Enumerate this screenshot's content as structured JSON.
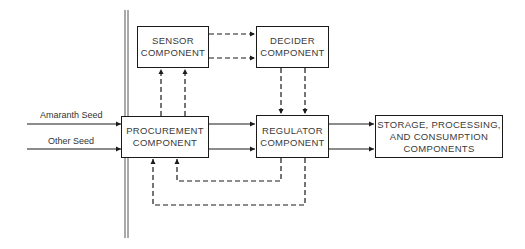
{
  "diagram": {
    "boxes": {
      "sensor": {
        "line1": "SENSOR",
        "line2": "COMPONENT"
      },
      "decider": {
        "line1": "DECIDER",
        "line2": "COMPONENT"
      },
      "procurement": {
        "line1": "PROCUREMENT",
        "line2": "COMPONENT"
      },
      "regulator": {
        "line1": "REGULATOR",
        "line2": "COMPONENT"
      },
      "storage": {
        "line1": "STORAGE, PROCESSING,",
        "line2": "AND CONSUMPTION",
        "line3": "COMPONENTS"
      }
    },
    "inputs": [
      {
        "label": "Amaranth Seed"
      },
      {
        "label": "Other Seed"
      }
    ],
    "colors": {
      "line": "#1a1a1a",
      "text": "#3a3a3a",
      "background": "#ffffff"
    }
  }
}
